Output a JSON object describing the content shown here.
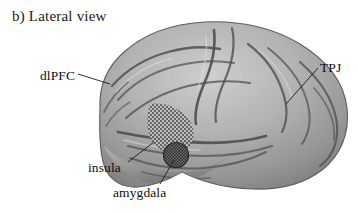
{
  "figure": {
    "panel_caption": "b) Lateral view",
    "background_color": "#ffffff",
    "text_color": "#101010",
    "width": 358,
    "height": 213
  },
  "brain": {
    "name": "lateral-view-brain-illustration",
    "orientation": "left lateral view, frontal pole at left, occipital pole at right",
    "style": "grayscale shaded cortical surface with gyri and sulci",
    "cortex_light": "#c8c8c8",
    "cortex_mid": "#a0a0a0",
    "cortex_dark": "#6d6d6d",
    "sulcus_color": "#4a4a4a",
    "outline_color": "#5a5a5a"
  },
  "regions": [
    {
      "id": "dlpfc",
      "label": "dlPFC",
      "marking": "leader line only",
      "label_x": 40,
      "label_y": 68,
      "leader": {
        "x1": 78,
        "y1": 74,
        "x2": 108,
        "y2": 82
      }
    },
    {
      "id": "tpj",
      "label": "TPJ",
      "marking": "leader line only",
      "label_x": 320,
      "label_y": 60,
      "leader": {
        "x1": 318,
        "y1": 68,
        "x2": 286,
        "y2": 104
      }
    },
    {
      "id": "insula",
      "label": "insula",
      "marking": "checkerboard hatched patch",
      "patch_fill": "#b4b4b4",
      "label_x": 88,
      "label_y": 160,
      "leader": {
        "x1": 128,
        "y1": 162,
        "x2": 152,
        "y2": 144
      }
    },
    {
      "id": "amygdala",
      "label": "amygdala",
      "marking": "dark dotted filled circle",
      "patch_fill": "#3a3a3a",
      "label_x": 113,
      "label_y": 185,
      "leader": {
        "x1": 160,
        "y1": 184,
        "x2": 174,
        "y2": 158
      }
    }
  ]
}
